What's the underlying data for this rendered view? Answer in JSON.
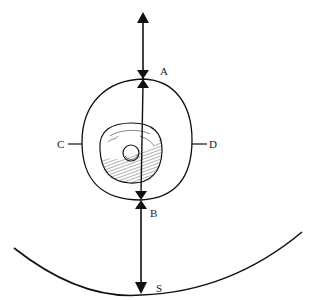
{
  "diagram": {
    "type": "cell-orientation-schematic",
    "labels": {
      "A": "A",
      "B": "B",
      "C": "C",
      "D": "D",
      "S": "S"
    },
    "colors": {
      "stroke": "#111111",
      "background": "#ffffff",
      "label": "#222222"
    },
    "elements": [
      "outer oval (cell boundary) with points A (top), B (bottom), C (left), D (right)",
      "inner hatched body with small sphere",
      "vertical double-headed arrow from top through A to B",
      "downward arrow from B to S",
      "large arc (surface) with point S at its lowest point"
    ]
  }
}
